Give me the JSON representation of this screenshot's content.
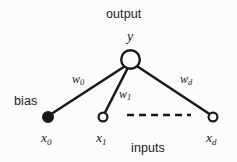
{
  "figure": {
    "title_label": "output",
    "inputs_label": "inputs",
    "bias_label": "bias",
    "background_color": "#fcfcfc",
    "stroke_color": "#1a1a1a"
  },
  "nodes": {
    "output": {
      "symbol": "y",
      "cx": 130.5,
      "cy": 59.5,
      "r": 9.5,
      "filled": false
    },
    "inputs": [
      {
        "id": "x0",
        "symbol": "x",
        "subscript": "0",
        "cx": 48,
        "cy": 117,
        "r": 5,
        "filled": true,
        "role": "bias"
      },
      {
        "id": "x1",
        "symbol": "x",
        "subscript": "1",
        "cx": 103,
        "cy": 117,
        "r": 4.6,
        "filled": false,
        "role": "input"
      },
      {
        "id": "xd",
        "symbol": "x",
        "subscript": "d",
        "cx": 213,
        "cy": 117,
        "r": 4.6,
        "filled": false,
        "role": "input"
      }
    ]
  },
  "weights": [
    {
      "id": "w0",
      "symbol": "w",
      "subscript": "0",
      "x": 72,
      "y": 73
    },
    {
      "id": "w1",
      "symbol": "w",
      "subscript": "1",
      "x": 119,
      "y": 88
    },
    {
      "id": "wd",
      "symbol": "w",
      "subscript": "d",
      "x": 180,
      "y": 73
    }
  ],
  "ellipsis": {
    "type": "dashed-line",
    "x1": 127,
    "x2": 191,
    "y": 115
  },
  "labels": {
    "output_x": 106,
    "output_y": 8,
    "y_x": 126,
    "y_y": 31,
    "bias_x": 14,
    "bias_y": 95,
    "inputs_x": 131,
    "inputs_y": 142,
    "x0_x": 41,
    "x0_y": 131,
    "x1_x": 96,
    "x1_y": 131,
    "xd_x": 206,
    "xd_y": 131
  }
}
